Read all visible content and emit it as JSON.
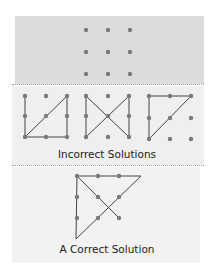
{
  "figure": {
    "sections": [
      {
        "id": "puzzle",
        "label": ""
      },
      {
        "id": "incorrect",
        "label": "Incorrect Solutions"
      },
      {
        "id": "correct",
        "label": "A Correct Solution"
      }
    ],
    "colors": {
      "top_panel": "#dcdcdc",
      "mid_panel": "#efefef",
      "bottom_panel": "#f2f2f2",
      "dot": "#7a7a7a",
      "line": "#444444"
    }
  },
  "captions": {
    "incorrect": "Incorrect Solutions",
    "correct": "A Correct Solution"
  }
}
